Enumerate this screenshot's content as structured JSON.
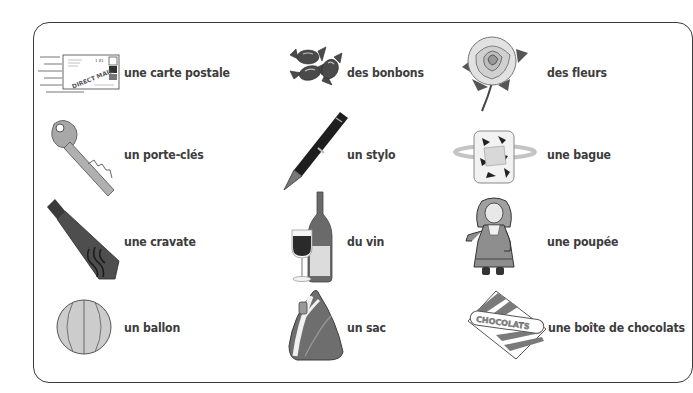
{
  "vocabulary": {
    "items": [
      {
        "label": "une carte postale",
        "icon": "postcard-icon"
      },
      {
        "label": "des bonbons",
        "icon": "candies-icon"
      },
      {
        "label": "des fleurs",
        "icon": "rose-icon"
      },
      {
        "label": "un porte-clés",
        "icon": "key-icon"
      },
      {
        "label": "un stylo",
        "icon": "fountain-pen-icon"
      },
      {
        "label": "une bague",
        "icon": "ring-icon"
      },
      {
        "label": "une cravate",
        "icon": "necktie-icon"
      },
      {
        "label": "du vin",
        "icon": "wine-icon"
      },
      {
        "label": "une poupée",
        "icon": "doll-icon"
      },
      {
        "label": "un ballon",
        "icon": "ball-icon"
      },
      {
        "label": "un sac",
        "icon": "backpack-icon"
      },
      {
        "label": "une boîte de chocolats",
        "icon": "chocolate-box-icon"
      }
    ],
    "postcard_stamp_text": "DIRECT MAIL",
    "postcard_number": "1 81",
    "chocolate_box_text": "CHOCOLATS"
  },
  "colors": {
    "border": "#3a3a3a",
    "text": "#3c3c3c",
    "dark_gray": "#4a4a4a",
    "mid_gray": "#8a8a8a",
    "light_gray": "#c8c8c8"
  }
}
